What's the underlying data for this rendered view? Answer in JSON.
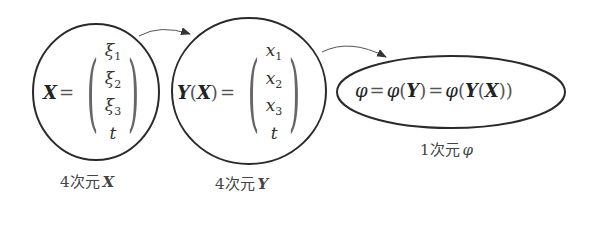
{
  "nodes": [
    {
      "id": "x-node",
      "lhs": "X",
      "equals": "=",
      "components": [
        {
          "base": "ξ",
          "sub": "1"
        },
        {
          "base": "ξ",
          "sub": "2"
        },
        {
          "base": "ξ",
          "sub": "3"
        },
        {
          "base": "t",
          "sub": ""
        }
      ],
      "caption_prefix": "4次元",
      "caption_var": "X"
    },
    {
      "id": "y-node",
      "lhs": "Y",
      "lhs_arg_open": "(",
      "lhs_arg": "X",
      "lhs_arg_close": ")",
      "equals": "=",
      "components": [
        {
          "base": "x",
          "sub": "1"
        },
        {
          "base": "x",
          "sub": "2"
        },
        {
          "base": "x",
          "sub": "3"
        },
        {
          "base": "t",
          "sub": ""
        }
      ],
      "caption_prefix": "4次元",
      "caption_var": "Y"
    },
    {
      "id": "phi-node",
      "expr": {
        "p1": "φ",
        "eq1": "=",
        "p2": "φ",
        "open1": "(",
        "y1": "Y",
        "close1": ")",
        "eq2": "=",
        "p3": "φ",
        "open2": "(",
        "y2": "Y",
        "open3": "(",
        "x": "X",
        "close3": ")",
        "close2": ")"
      },
      "caption_prefix": "1次元",
      "caption_var": "φ"
    }
  ],
  "edges": [
    {
      "from": "x-node",
      "to": "y-node"
    },
    {
      "from": "y-node",
      "to": "phi-node"
    }
  ],
  "colors": {
    "stroke": "#2a2a2a",
    "arrow": "#555555",
    "text": "#222222"
  }
}
